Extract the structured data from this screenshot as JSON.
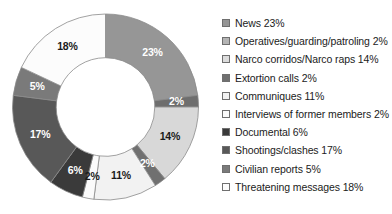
{
  "chart_data": {
    "type": "pie",
    "variant": "donut",
    "title": "",
    "subtitle": "",
    "xlabel": "",
    "ylabel": "",
    "grid": false,
    "legend_position": "right",
    "start_angle_deg": 0,
    "direction": "clockwise",
    "inner_radius_ratio": 0.53,
    "value_unit": "percent",
    "total": 100,
    "categories": [
      "News",
      "Operatives/guarding/patroling",
      "Narco corridos/Narco raps",
      "Extortion calls",
      "Communiques",
      "Interviews of former members",
      "Documental",
      "Shootings/clashes",
      "Civilian reports",
      "Threatening messages"
    ],
    "values": [
      23,
      2,
      14,
      2,
      11,
      2,
      6,
      17,
      5,
      18
    ],
    "data_labels": [
      "23%",
      "2%",
      "14%",
      "2%",
      "11%",
      "2%",
      "6%",
      "17%",
      "5%",
      "18%"
    ],
    "colors": [
      "#969696",
      "#6e6e6e",
      "#d8d8d8",
      "#707070",
      "#f2f2f2",
      "#fbfbfb",
      "#3a3a3a",
      "#585858",
      "#7a7a7a",
      "#fcfcfc"
    ],
    "label_text_colors": [
      "#ffffff",
      "#ffffff",
      "#1a1a1a",
      "#ffffff",
      "#1a1a1a",
      "#1a1a1a",
      "#ffffff",
      "#ffffff",
      "#ffffff",
      "#1a1a1a"
    ]
  },
  "legend": {
    "items": [
      {
        "label": "News 23%",
        "color": "#969696"
      },
      {
        "label": "Operatives/guarding/patroling 2%",
        "color": "#b4b4b4"
      },
      {
        "label": "Narco corridos/Narco raps 14%",
        "color": "#dcdcdc"
      },
      {
        "label": "Extortion calls 2%",
        "color": "#707070"
      },
      {
        "label": "Communiques 11%",
        "color": "#f2f2f2"
      },
      {
        "label": "Interviews of former members 2%",
        "color": "#fbfbfb"
      },
      {
        "label": "Documental 6%",
        "color": "#3a3a3a"
      },
      {
        "label": "Shootings/clashes 17%",
        "color": "#585858"
      },
      {
        "label": "Civilian reports 5%",
        "color": "#7a7a7a"
      },
      {
        "label": "Threatening messages 18%",
        "color": "#fcfcfc"
      }
    ]
  }
}
